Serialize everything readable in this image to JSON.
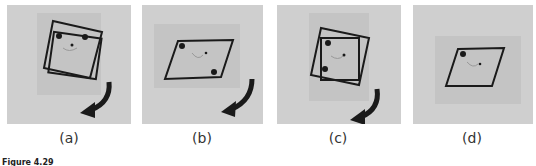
{
  "figure": {
    "caption": "Figure 4.29",
    "panels": [
      {
        "label": "(a)",
        "description": "square camera frame rotated, two dots top corners, face, curved arrow"
      },
      {
        "label": "(b)",
        "description": "parallelogram frame, dots at diagonal corners, curved arrow"
      },
      {
        "label": "(c)",
        "description": "rotated square frames, dots on left side, curved arrow"
      },
      {
        "label": "(d)",
        "description": "parallelogram frame, single dot top-left, no arrow"
      }
    ],
    "colors": {
      "background": "#cfcfcf",
      "inner": "#c4c4c4",
      "stroke": "#1a1a1a"
    }
  }
}
